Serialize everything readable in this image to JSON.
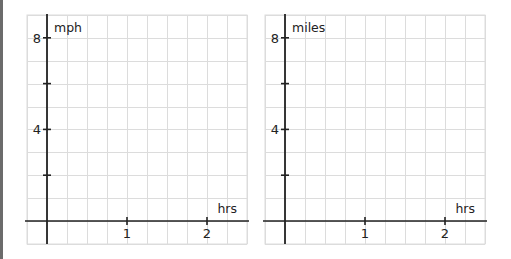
{
  "chart_data": [
    {
      "type": "line",
      "title": "",
      "xlabel": "hrs",
      "ylabel": "mph",
      "xlim": [
        -0.25,
        2.5
      ],
      "ylim": [
        -1,
        9
      ],
      "x_ticks": [
        1,
        2
      ],
      "x_tick_labels": [
        "1",
        "2"
      ],
      "y_ticks": [
        2,
        4,
        6,
        8
      ],
      "y_tick_labels": [
        "",
        "4",
        "",
        "8"
      ],
      "grid": true,
      "grid_step_x": 0.25,
      "grid_step_y": 1,
      "series": []
    },
    {
      "type": "line",
      "title": "",
      "xlabel": "hrs",
      "ylabel": "miles",
      "xlim": [
        -0.25,
        2.5
      ],
      "ylim": [
        -1,
        9
      ],
      "x_ticks": [
        1,
        2
      ],
      "x_tick_labels": [
        "1",
        "2"
      ],
      "y_ticks": [
        2,
        4,
        6,
        8
      ],
      "y_tick_labels": [
        "",
        "4",
        "",
        "8"
      ],
      "grid": true,
      "grid_step_x": 0.25,
      "grid_step_y": 1,
      "series": []
    }
  ],
  "colors": {
    "grid": "#dcdcdc",
    "axis": "#222222"
  }
}
